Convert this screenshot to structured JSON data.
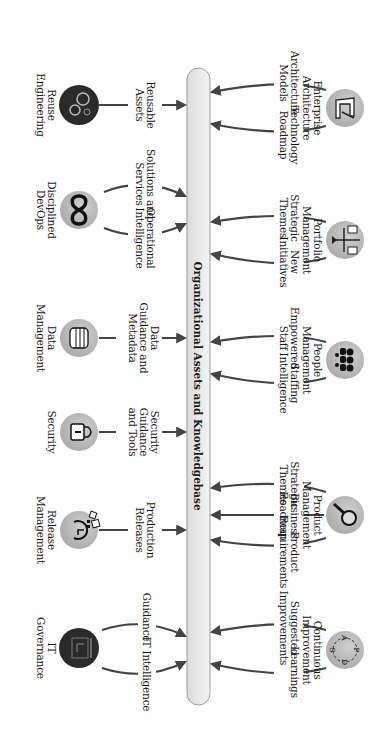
{
  "central_bar": {
    "label": "Organizational Assets and Knowledgebase"
  },
  "top_nodes": [
    {
      "name": "Enterprise Architecture",
      "line1": "Enterprise",
      "line2": "Architecture",
      "icon": "architect-drawing-icon",
      "outputs": [
        {
          "line1": "Architecture",
          "line2": "Models"
        },
        {
          "line1": "Technology",
          "line2": "Roadmap"
        }
      ]
    },
    {
      "name": "Portfolio Management",
      "line1": "Portfolio",
      "line2": "Management",
      "icon": "balance-scale-icon",
      "outputs": [
        {
          "line1": "Strategic",
          "line2": "Themes"
        },
        {
          "line1": "New",
          "line2": "Initiatives"
        }
      ]
    },
    {
      "name": "People Management",
      "line1": "People",
      "line2": "Management",
      "icon": "people-group-icon",
      "outputs": [
        {
          "line1": "Empowered",
          "line2": "Staff"
        },
        {
          "line1": "Staffing",
          "line2": "Intelligence"
        }
      ]
    },
    {
      "name": "Product Management",
      "line1": "Product",
      "line2": "Management",
      "icon": "magnifier-icon",
      "outputs": [
        {
          "line1": "Strategic",
          "line2": "Themes"
        },
        {
          "line1": "Business",
          "line2": "Roadmap"
        },
        {
          "line1": "Product",
          "line2": "Requirements"
        }
      ]
    },
    {
      "name": "Continuous Improvement",
      "line1": "Continuous",
      "line2": "Improvement",
      "icon": "pdsa-cycle-icon",
      "icon_letters": [
        "P",
        "D",
        "S",
        "A"
      ],
      "outputs": [
        {
          "line1": "Suggested",
          "line2": "Improvements"
        },
        {
          "line1": "Learnings",
          "line2": ""
        }
      ]
    }
  ],
  "bottom_nodes": [
    {
      "name": "Reuse Engineering",
      "line1": "Reuse",
      "line2": "Engineering",
      "icon": "gears-icon",
      "outputs": [
        {
          "line1": "Reusable",
          "line2": "Assets",
          "line3": ""
        }
      ]
    },
    {
      "name": "Disciplined DevOps",
      "line1": "Disciplined",
      "line2": "DevOps",
      "icon": "infinity-loop-icon",
      "outputs": [
        {
          "line1": "Solutions and",
          "line2": "Services",
          "line3": ""
        },
        {
          "line1": "Operational",
          "line2": "Intelligence",
          "line3": ""
        }
      ]
    },
    {
      "name": "Data Management",
      "line1": "Data",
      "line2": "Management",
      "icon": "database-icon",
      "outputs": [
        {
          "line1": "Data",
          "line2": "Guidance and",
          "line3": "Metadata"
        }
      ]
    },
    {
      "name": "Security",
      "line1": "Security",
      "line2": "",
      "icon": "padlock-icon",
      "outputs": [
        {
          "line1": "Security",
          "line2": "Guidance",
          "line3": "and Tools"
        }
      ]
    },
    {
      "name": "Release Management",
      "line1": "Release",
      "line2": "Management",
      "icon": "release-cycle-icon",
      "outputs": [
        {
          "line1": "Production",
          "line2": "Releases",
          "line3": ""
        }
      ]
    },
    {
      "name": "IT Governance",
      "line1": "IT",
      "line2": "Governance",
      "icon": "governance-board-icon",
      "outputs": [
        {
          "line1": "Guidance",
          "line2": "",
          "line3": ""
        },
        {
          "line1": "IT Intelligence",
          "line2": "",
          "line3": ""
        }
      ]
    }
  ],
  "colors": {
    "icon_light": "#b5b5b5",
    "icon_dark": "#2a2a2a",
    "arrow": "#444444",
    "bar_fill": "#ececec",
    "bar_stroke": "#9a9a9a"
  }
}
